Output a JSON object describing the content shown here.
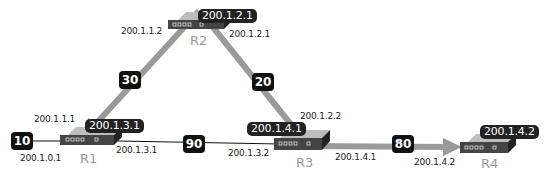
{
  "colors": {
    "link": "#111111",
    "arrow": "#999999",
    "router_body": "#444444",
    "router_top": "#bdbdbd",
    "label_bg": "#222222",
    "router_name": "#999999"
  },
  "routers": [
    {
      "id": "R1",
      "name": "R1",
      "tag": "200.1.3.1"
    },
    {
      "id": "R2",
      "name": "R2",
      "tag": "200.1.2.1"
    },
    {
      "id": "R3",
      "name": "R3",
      "tag": "200.1.4.1"
    },
    {
      "id": "R4",
      "name": "R4",
      "tag": "200.1.4.2"
    }
  ],
  "links": [
    {
      "from": "ext",
      "to": "R1",
      "cost": "10",
      "ip_to": "200.1.0.1"
    },
    {
      "from": "R1",
      "to": "R2",
      "cost": "30",
      "ip_from": "200.1.1.1",
      "ip_to": "200.1.1.2",
      "highlighted": true
    },
    {
      "from": "R2",
      "to": "R3",
      "cost": "20",
      "ip_from": "200.1.2.1",
      "ip_to": "200.1.2.2",
      "highlighted": true
    },
    {
      "from": "R1",
      "to": "R3",
      "cost": "90",
      "ip_from": "200.1.3.1",
      "ip_to": "200.1.3.2"
    },
    {
      "from": "R3",
      "to": "R4",
      "cost": "80",
      "ip_from": "200.1.4.1",
      "ip_to": "200.1.4.2",
      "highlighted": true
    }
  ]
}
